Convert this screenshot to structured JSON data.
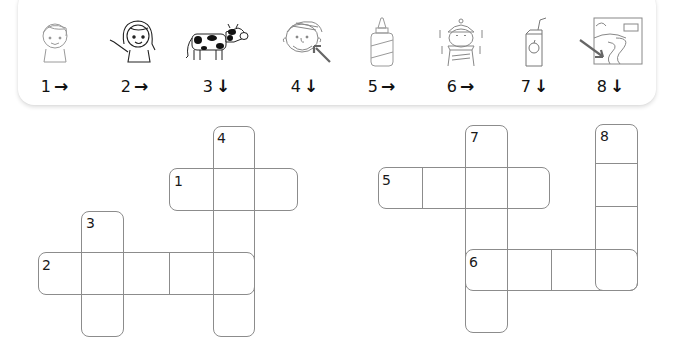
{
  "clues": [
    {
      "number": "1",
      "direction": "across",
      "arrow": "→",
      "icon": "boy-icon",
      "x": 30
    },
    {
      "number": "2",
      "direction": "across",
      "arrow": "→",
      "icon": "girl-pointing-icon",
      "x": 110
    },
    {
      "number": "3",
      "direction": "down",
      "arrow": "↓",
      "icon": "cow-icon",
      "x": 187
    },
    {
      "number": "4",
      "direction": "down",
      "arrow": "↓",
      "icon": "face-arrow-mouth-icon",
      "x": 275
    },
    {
      "number": "5",
      "direction": "across",
      "arrow": "→",
      "icon": "glue-bottle-icon",
      "x": 350
    },
    {
      "number": "6",
      "direction": "across",
      "arrow": "→",
      "icon": "cold-boy-icon",
      "x": 428
    },
    {
      "number": "7",
      "direction": "down",
      "arrow": "↓",
      "icon": "juice-box-icon",
      "x": 505
    },
    {
      "number": "8",
      "direction": "down",
      "arrow": "↓",
      "icon": "river-picture-icon",
      "x": 572
    }
  ],
  "puzzles": {
    "left": {
      "words": [
        {
          "number": "1",
          "direction": "across",
          "length": 3
        },
        {
          "number": "2",
          "direction": "across",
          "length": 5
        },
        {
          "number": "3",
          "direction": "down",
          "length": 3
        },
        {
          "number": "4",
          "direction": "down",
          "length": 5
        }
      ]
    },
    "right": {
      "words": [
        {
          "number": "5",
          "direction": "across",
          "length": 4
        },
        {
          "number": "6",
          "direction": "across",
          "length": 4
        },
        {
          "number": "7",
          "direction": "down",
          "length": 5
        },
        {
          "number": "8",
          "direction": "down",
          "length": 4
        }
      ]
    }
  },
  "colors": {
    "grid_line": "#8c8c8c",
    "text": "#111111",
    "card_bg": "#ffffff"
  }
}
